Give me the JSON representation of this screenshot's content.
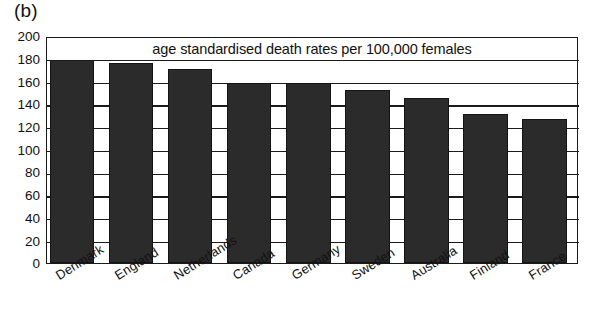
{
  "panel": {
    "label": "(b)"
  },
  "chart_data": {
    "type": "bar",
    "title": "age standardised death rates per 100,000 females",
    "xlabel": "",
    "ylabel": "",
    "ylim": [
      0,
      200
    ],
    "yticks": [
      0,
      20,
      40,
      60,
      80,
      100,
      120,
      140,
      160,
      180,
      200
    ],
    "grid": true,
    "legend": false,
    "bar_color": "#2b2b2b",
    "categories": [
      "Denmark",
      "England",
      "Netherlands",
      "Canada",
      "Germany",
      "Sweden",
      "Australia",
      "Finland",
      "France"
    ],
    "values": [
      179,
      176,
      171,
      159,
      159,
      152,
      145,
      131,
      127
    ]
  }
}
